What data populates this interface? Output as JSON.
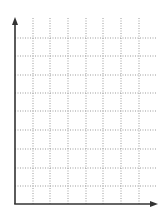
{
  "chart_data": {
    "type": "line",
    "title": "",
    "xlabel": "",
    "ylabel": "",
    "series": [],
    "x_ticks": [],
    "y_ticks": [],
    "grid": true,
    "grid_style": "dotted",
    "grid_columns": 8,
    "grid_rows": 9,
    "legend": null
  },
  "style": {
    "axis_color": "#333333",
    "grid_color": "#9a9a9a",
    "background": "#ffffff"
  },
  "layout": {
    "origin_x": 15,
    "origin_y": 204,
    "x_axis_end": 158,
    "y_axis_top": 17,
    "v_lines": [
      33,
      50,
      68,
      86,
      103,
      121,
      139
    ],
    "h_lines": [
      38,
      56,
      75,
      93,
      111,
      130,
      149,
      168,
      186
    ],
    "grid_right": 157,
    "grid_top": 18
  }
}
